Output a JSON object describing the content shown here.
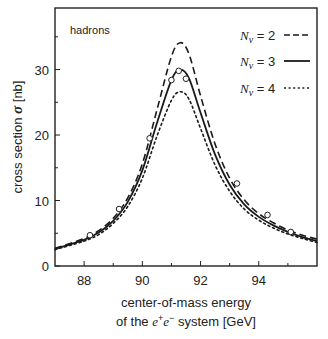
{
  "chart_data": {
    "type": "line",
    "title": "",
    "annotation": "hadrons",
    "xlabel_line1": "center-of-mass energy",
    "xlabel_line2_prefix": "of the ",
    "xlabel_line2_particle": "e",
    "xlabel_line2_suffix": " system [GeV]",
    "ylabel": "cross section",
    "ylabel_symbol": "σ",
    "ylabel_unit": "[nb]",
    "xlim": [
      87,
      96
    ],
    "ylim": [
      0,
      39.4
    ],
    "xticks": [
      88,
      90,
      92,
      94
    ],
    "xticks_minor": [
      89,
      91,
      93,
      95
    ],
    "yticks": [
      0,
      10,
      20,
      30
    ],
    "yticks_minor": [
      5,
      15,
      25,
      35
    ],
    "grid": false,
    "legend_position": "upper right",
    "series": [
      {
        "name": "N_ν = 2",
        "label_main": "N",
        "label_sub": "ν",
        "label_eq": " = 2",
        "style": "dashed",
        "peak": 34.1,
        "peak_x": 91.3,
        "x": [
          87.0,
          88.0,
          88.5,
          89.0,
          89.5,
          90.0,
          90.5,
          91.0,
          91.3,
          91.6,
          92.0,
          92.5,
          93.0,
          93.5,
          94.0,
          94.5,
          95.0,
          95.5,
          96.0
        ],
        "y": [
          2.7,
          4.2,
          5.4,
          7.3,
          10.4,
          15.6,
          23.8,
          32.0,
          34.1,
          32.4,
          26.0,
          18.6,
          13.4,
          10.1,
          8.0,
          6.6,
          5.5,
          4.7,
          4.1
        ]
      },
      {
        "name": "N_ν = 3",
        "label_main": "N",
        "label_sub": "ν",
        "label_eq": " = 3",
        "style": "solid",
        "peak": 30.0,
        "peak_x": 91.3,
        "x": [
          87.0,
          88.0,
          88.5,
          89.0,
          89.5,
          90.0,
          90.5,
          91.0,
          91.3,
          91.6,
          92.0,
          92.5,
          93.0,
          93.5,
          94.0,
          94.5,
          95.0,
          95.5,
          96.0
        ],
        "y": [
          2.6,
          4.0,
          5.1,
          6.9,
          9.8,
          14.6,
          21.8,
          28.4,
          30.0,
          28.7,
          23.4,
          17.0,
          12.4,
          9.4,
          7.5,
          6.2,
          5.2,
          4.4,
          3.8
        ]
      },
      {
        "name": "N_ν = 4",
        "label_main": "N",
        "label_sub": "ν",
        "label_eq": " = 4",
        "style": "dotted",
        "peak": 26.6,
        "peak_x": 91.3,
        "x": [
          87.0,
          88.0,
          88.5,
          89.0,
          89.5,
          90.0,
          90.5,
          91.0,
          91.3,
          91.6,
          92.0,
          92.5,
          93.0,
          93.5,
          94.0,
          94.5,
          95.0,
          95.5,
          96.0
        ],
        "y": [
          2.5,
          3.8,
          4.8,
          6.5,
          9.1,
          13.4,
          19.8,
          25.3,
          26.6,
          25.5,
          21.0,
          15.4,
          11.4,
          8.7,
          7.0,
          5.8,
          4.9,
          4.2,
          3.6
        ]
      }
    ],
    "data_points": {
      "name": "measurements",
      "marker": "open circle",
      "x": [
        88.2,
        89.2,
        90.25,
        91.0,
        91.25,
        91.5,
        93.25,
        94.3,
        95.1
      ],
      "y": [
        4.7,
        8.7,
        19.5,
        28.4,
        29.8,
        28.6,
        12.6,
        7.8,
        5.2
      ]
    }
  }
}
